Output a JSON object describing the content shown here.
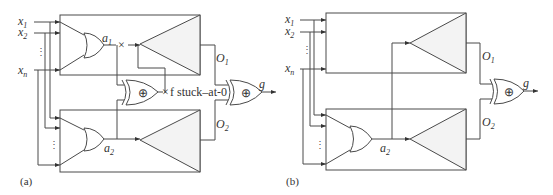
{
  "panel_a": {
    "caption": "(a)",
    "inputs": [
      {
        "name": "x",
        "sub": "1"
      },
      {
        "name": "x",
        "sub": "2"
      },
      {
        "name": "x",
        "sub": "n"
      }
    ],
    "vdots": "⋮",
    "signal_a1": {
      "name": "a",
      "sub": "1"
    },
    "signal_a2": {
      "name": "a",
      "sub": "2"
    },
    "output_o1": {
      "name": "O",
      "sub": "1"
    },
    "output_o2": {
      "name": "O",
      "sub": "2"
    },
    "output_g": "g",
    "fault_label": "f stuck–at-0",
    "fault_marker": "×",
    "xor_symbol": "⊕"
  },
  "panel_b": {
    "caption": "(b)",
    "inputs": [
      {
        "name": "x",
        "sub": "1"
      },
      {
        "name": "x",
        "sub": "2"
      },
      {
        "name": "x",
        "sub": "n"
      }
    ],
    "vdots": "⋮",
    "signal_a2": {
      "name": "a",
      "sub": "2"
    },
    "output_o1": {
      "name": "O",
      "sub": "1"
    },
    "output_o2": {
      "name": "O",
      "sub": "2"
    },
    "output_g": "g",
    "xor_symbol": "⊕"
  },
  "colors": {
    "line": "#4a4a4a",
    "triangle_fill": "#f3f3f3"
  }
}
